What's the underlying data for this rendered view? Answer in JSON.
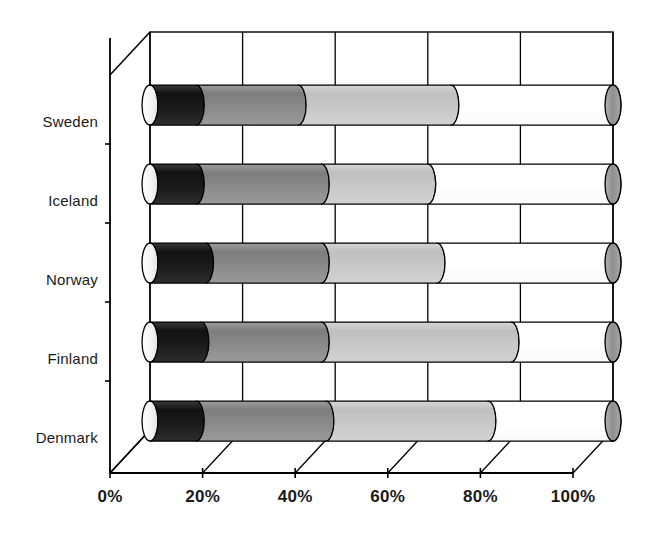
{
  "chart_data": {
    "type": "bar",
    "orientation": "horizontal",
    "stacked": true,
    "percent_stacked": true,
    "style": "3d-cylinder",
    "title": "",
    "subtitle": "",
    "xlabel": "",
    "ylabel": "",
    "xlim": [
      0,
      100
    ],
    "xtick_labels": [
      "0%",
      "20%",
      "40%",
      "60%",
      "80%",
      "100%"
    ],
    "xticks": [
      0,
      20,
      40,
      60,
      80,
      100
    ],
    "grid": true,
    "grid_axis": "x",
    "legend": false,
    "legend_position": "none",
    "categories": [
      "Sweden",
      "Iceland",
      "Norway",
      "Finland",
      "Denmark"
    ],
    "series": [
      {
        "name": "Series 1",
        "color": "#1a1a1a",
        "values": [
          10,
          10,
          12,
          11,
          10
        ]
      },
      {
        "name": "Series 2",
        "color": "#8a8a8a",
        "values": [
          22,
          27,
          25,
          26,
          28
        ]
      },
      {
        "name": "Series 3",
        "color": "#c8c8c8",
        "values": [
          33,
          23,
          25,
          41,
          35
        ]
      },
      {
        "name": "Series 4",
        "color": "#ffffff",
        "values": [
          35,
          40,
          38,
          22,
          27
        ]
      }
    ]
  },
  "axes": {
    "x_tick_labels": [
      "0%",
      "20%",
      "40%",
      "60%",
      "80%",
      "100%"
    ],
    "y_tick_labels": [
      "Sweden",
      "Iceland",
      "Norway",
      "Finland",
      "Denmark"
    ]
  },
  "colors": {
    "segment_1": "#1a1a1a",
    "segment_2": "#8a8a8a",
    "segment_3": "#c8c8c8",
    "segment_4": "#ffffff",
    "cap_shade": "#9a9a9a",
    "axis": "#000000",
    "grid": "#000000",
    "background": "#ffffff"
  }
}
